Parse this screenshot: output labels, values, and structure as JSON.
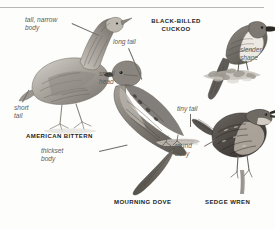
{
  "plate": {
    "background": "#fdfdfb",
    "rule_color": "#b9b7b2",
    "label_color": "#231f1d",
    "annotation_color": "#5d5a57",
    "leader_color": "#6f6c68"
  },
  "species": [
    {
      "id": "american-bittern",
      "name": "AMERICAN BITTERN",
      "annotations": [
        {
          "id": "tall-narrow-body",
          "line1": "tall, narrow",
          "line2": "body"
        },
        {
          "id": "short-tail",
          "line1": "short",
          "line2": "tail"
        }
      ]
    },
    {
      "id": "black-billed-cuckoo",
      "name_line1": "BLACK-BILLED",
      "name_line2": "CUCKOO",
      "name": "BLACK-BILLED CUCKOO",
      "annotations": [
        {
          "id": "slender-shape",
          "line1": "slender",
          "line2": "shape"
        }
      ]
    },
    {
      "id": "mourning-dove",
      "name": "MOURNING DOVE",
      "annotations": [
        {
          "id": "long-tail",
          "line1": "long tail",
          "line2": ""
        },
        {
          "id": "small-head",
          "line1": "small",
          "line2": "head"
        },
        {
          "id": "thickset-body",
          "line1": "thickset",
          "line2": "body"
        }
      ]
    },
    {
      "id": "sedge-wren",
      "name": "SEDGE WREN",
      "annotations": [
        {
          "id": "tiny-tail",
          "line1": "tiny tail",
          "line2": ""
        },
        {
          "id": "round-body",
          "line1": "round",
          "line2": "body"
        }
      ]
    }
  ]
}
